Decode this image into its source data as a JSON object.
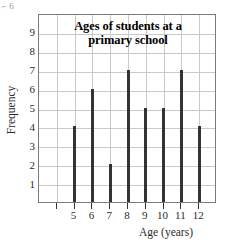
{
  "artifact": {
    "marks": "⌐\n6"
  },
  "chart_data": {
    "type": "bar",
    "title_lines": [
      "Ages of students at a",
      "primary school"
    ],
    "xlabel": "Age (years)",
    "ylabel": "Frequency",
    "categories": [
      "5",
      "6",
      "7",
      "8",
      "9",
      "10",
      "11",
      "12"
    ],
    "values": [
      4,
      6,
      2,
      7,
      5,
      5,
      7,
      4
    ],
    "ylim": [
      0,
      10
    ],
    "y_ticks": [
      "1",
      "2",
      "3",
      "4",
      "5",
      "6",
      "7",
      "8",
      "9"
    ],
    "y_tick_values": [
      1,
      2,
      3,
      4,
      5,
      6,
      7,
      8,
      9
    ],
    "grid": true,
    "legend": "none",
    "bar_color": "#333333",
    "grid_color": "#c9c9c9",
    "frame_color": "#7a7a7a",
    "leading_empty_columns": 1,
    "trailing_empty_columns": 1
  }
}
